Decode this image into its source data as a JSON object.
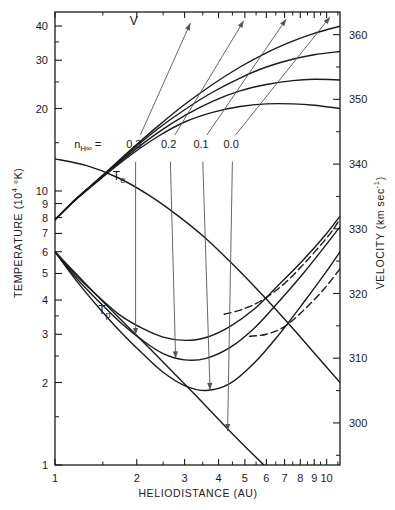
{
  "chart_data": {
    "type": "line",
    "title": "",
    "xlabel": "HELIODISTANCE  (AU)",
    "ylabel": "TEMPERATURE  (10⁴ °K)",
    "y2label": "VELOCITY  (km sec⁻¹)",
    "xscale": "log",
    "yscale": "log",
    "y2scale": "linear",
    "xlim": [
      1,
      11.2
    ],
    "ylim": [
      1,
      45
    ],
    "y2lim": [
      293.5,
      363.5
    ],
    "grid": false,
    "legend_position": "inline-annotations",
    "xticks": [
      1,
      2,
      3,
      4,
      5,
      6,
      7,
      8,
      9,
      10
    ],
    "xtick_labels": [
      "1",
      "2",
      "3",
      "4",
      "5",
      "6",
      "7",
      "8",
      "9",
      "10"
    ],
    "xminor": [
      1.5,
      2.5,
      3.5,
      4.5,
      5.5,
      6.5,
      7.5,
      8.5,
      9.5,
      11
    ],
    "yticks": [
      1,
      2,
      3,
      4,
      5,
      6,
      7,
      8,
      9,
      10,
      20,
      30,
      40
    ],
    "ytick_labels": [
      "1",
      "2",
      "3",
      "4",
      "5",
      "6",
      "7",
      "8",
      "9",
      "10",
      "20",
      "30",
      "40"
    ],
    "ytick_labeled": [
      true,
      true,
      true,
      true,
      true,
      true,
      true,
      true,
      true,
      true,
      true,
      true,
      true
    ],
    "yminor": [
      1.5,
      2.5,
      3.5,
      15,
      25,
      35
    ],
    "y2ticks": [
      300,
      310,
      320,
      330,
      340,
      350,
      360
    ],
    "y2tick_labels": [
      "300",
      "310",
      "320",
      "330",
      "340",
      "350",
      "360"
    ],
    "y2minor": [
      295,
      305,
      315,
      325,
      335,
      345,
      355
    ],
    "parameter_name": "n_H∞",
    "parameter_values": [
      "0.3",
      "0.2",
      "0.1",
      "0.0"
    ],
    "series": [
      {
        "name": "V",
        "label": "V",
        "axis": "right",
        "style": "solid",
        "param": "0.3",
        "points": [
          [
            1,
            331.4
          ],
          [
            1.2,
            334.6
          ],
          [
            1.5,
            338.0
          ],
          [
            1.9,
            341.4
          ],
          [
            2.4,
            344.3
          ],
          [
            3.0,
            346.5
          ],
          [
            3.8,
            348.0
          ],
          [
            4.8,
            348.9
          ],
          [
            6.0,
            349.3
          ],
          [
            7.5,
            349.3
          ],
          [
            9.0,
            349.1
          ],
          [
            11.2,
            348.6
          ]
        ]
      },
      {
        "name": "V",
        "label": "",
        "axis": "right",
        "style": "solid",
        "param": "0.2",
        "points": [
          [
            1,
            331.4
          ],
          [
            1.2,
            334.6
          ],
          [
            1.5,
            338.1
          ],
          [
            1.9,
            341.7
          ],
          [
            2.4,
            344.9
          ],
          [
            3.0,
            347.5
          ],
          [
            3.8,
            349.7
          ],
          [
            4.8,
            351.3
          ],
          [
            6.0,
            352.3
          ],
          [
            7.5,
            352.9
          ],
          [
            9.0,
            353.1
          ],
          [
            11.2,
            353.0
          ]
        ]
      },
      {
        "name": "V",
        "label": "",
        "axis": "right",
        "style": "solid",
        "param": "0.1",
        "points": [
          [
            1,
            331.4
          ],
          [
            1.2,
            334.7
          ],
          [
            1.5,
            338.2
          ],
          [
            1.9,
            342.0
          ],
          [
            2.4,
            345.5
          ],
          [
            3.0,
            348.4
          ],
          [
            3.8,
            351.1
          ],
          [
            4.8,
            353.3
          ],
          [
            6.0,
            355.0
          ],
          [
            7.5,
            356.2
          ],
          [
            9.0,
            356.9
          ],
          [
            11.2,
            357.4
          ]
        ]
      },
      {
        "name": "V",
        "label": "",
        "axis": "right",
        "style": "solid",
        "param": "0.0",
        "points": [
          [
            1,
            331.4
          ],
          [
            1.2,
            334.7
          ],
          [
            1.5,
            338.3
          ],
          [
            1.9,
            342.2
          ],
          [
            2.4,
            345.9
          ],
          [
            3.0,
            349.2
          ],
          [
            3.8,
            352.3
          ],
          [
            4.8,
            355.0
          ],
          [
            6.0,
            357.2
          ],
          [
            7.5,
            359.0
          ],
          [
            9.0,
            360.2
          ],
          [
            11.2,
            361.3
          ]
        ]
      },
      {
        "name": "Te",
        "label": "Tₑ",
        "axis": "left",
        "style": "solid",
        "param": "",
        "points": [
          [
            1,
            13.1
          ],
          [
            1.3,
            12.4
          ],
          [
            1.7,
            11.2
          ],
          [
            2.2,
            9.7
          ],
          [
            2.8,
            8.2
          ],
          [
            3.6,
            6.7
          ],
          [
            4.6,
            5.3
          ],
          [
            5.9,
            4.1
          ],
          [
            7.4,
            3.2
          ],
          [
            9.2,
            2.5
          ],
          [
            11.2,
            2.0
          ]
        ]
      },
      {
        "name": "Tp",
        "label": "Tₚ",
        "axis": "left",
        "style": "solid",
        "param": "0.3",
        "points": [
          [
            1,
            6.0
          ],
          [
            1.2,
            4.9
          ],
          [
            1.45,
            4.1
          ],
          [
            1.75,
            3.5
          ],
          [
            2.1,
            3.15
          ],
          [
            2.5,
            2.93
          ],
          [
            3.0,
            2.85
          ],
          [
            3.6,
            2.92
          ],
          [
            4.4,
            3.2
          ],
          [
            5.4,
            3.7
          ],
          [
            6.6,
            4.5
          ],
          [
            8.2,
            5.6
          ],
          [
            10.0,
            7.0
          ],
          [
            11.2,
            8.1
          ]
        ]
      },
      {
        "name": "Tp",
        "label": "",
        "axis": "left",
        "style": "solid",
        "param": "0.2",
        "points": [
          [
            1,
            6.0
          ],
          [
            1.2,
            4.8
          ],
          [
            1.45,
            3.95
          ],
          [
            1.75,
            3.3
          ],
          [
            2.1,
            2.85
          ],
          [
            2.5,
            2.55
          ],
          [
            3.0,
            2.42
          ],
          [
            3.6,
            2.45
          ],
          [
            4.4,
            2.68
          ],
          [
            5.4,
            3.15
          ],
          [
            6.6,
            3.9
          ],
          [
            8.2,
            5.0
          ],
          [
            10.0,
            6.4
          ],
          [
            11.2,
            7.4
          ]
        ]
      },
      {
        "name": "Tp",
        "label": "",
        "axis": "left",
        "style": "solid",
        "param": "0.1",
        "points": [
          [
            1,
            6.0
          ],
          [
            1.2,
            4.7
          ],
          [
            1.45,
            3.75
          ],
          [
            1.75,
            3.05
          ],
          [
            2.1,
            2.55
          ],
          [
            2.5,
            2.18
          ],
          [
            3.0,
            1.95
          ],
          [
            3.6,
            1.87
          ],
          [
            4.4,
            1.98
          ],
          [
            5.4,
            2.35
          ],
          [
            6.6,
            2.95
          ],
          [
            8.2,
            3.9
          ],
          [
            10.0,
            5.1
          ],
          [
            11.2,
            6.0
          ]
        ]
      },
      {
        "name": "Tp",
        "label": "",
        "axis": "left",
        "style": "solid",
        "param": "0.0",
        "points": [
          [
            1,
            6.0
          ],
          [
            1.5,
            3.95
          ],
          [
            2.2,
            2.7
          ],
          [
            3.2,
            1.85
          ],
          [
            4.6,
            1.27
          ],
          [
            6.0,
            0.98
          ],
          [
            7.0,
            0.85
          ]
        ]
      },
      {
        "name": "dashed-upper",
        "label": "",
        "axis": "left",
        "style": "dashed",
        "param": "",
        "points": [
          [
            4.2,
            3.55
          ],
          [
            4.9,
            3.7
          ],
          [
            5.8,
            4.0
          ],
          [
            7.0,
            4.6
          ],
          [
            8.5,
            5.6
          ],
          [
            10.2,
            6.9
          ],
          [
            11.2,
            7.9
          ]
        ]
      },
      {
        "name": "dashed-lower",
        "label": "",
        "axis": "left",
        "style": "dashed",
        "param": "",
        "points": [
          [
            5.2,
            2.95
          ],
          [
            6.0,
            3.0
          ],
          [
            7.0,
            3.2
          ],
          [
            8.3,
            3.7
          ],
          [
            9.8,
            4.4
          ],
          [
            11.2,
            5.2
          ]
        ]
      }
    ],
    "annotations": [
      {
        "text": "V",
        "x": 1.95,
        "y": 40.5,
        "name": "curve-label-v"
      },
      {
        "text": "Tₑ",
        "x": 1.72,
        "y": 11.0,
        "name": "curve-label-te"
      },
      {
        "text": "Tₚ",
        "x": 1.52,
        "y": 3.55,
        "name": "curve-label-tp"
      },
      {
        "text": "n_H∞ =",
        "x": 1.32,
        "y": 14.3,
        "name": "parameter-name-label"
      },
      {
        "text": "0.3",
        "x": 1.95,
        "y": 14.3,
        "name": "parameter-label-03"
      },
      {
        "text": "0.2",
        "x": 2.62,
        "y": 14.3,
        "name": "parameter-label-02"
      },
      {
        "text": "0.1",
        "x": 3.45,
        "y": 14.3,
        "name": "parameter-label-01"
      },
      {
        "text": "0.0",
        "x": 4.45,
        "y": 14.3,
        "name": "parameter-label-00"
      }
    ],
    "leaders_down": [
      {
        "from": [
          1.98,
          12.8
        ],
        "to": [
          1.98,
          2.98
        ],
        "param": "0.3"
      },
      {
        "from": [
          2.66,
          12.8
        ],
        "to": [
          2.78,
          2.45
        ],
        "param": "0.2"
      },
      {
        "from": [
          3.5,
          12.8
        ],
        "to": [
          3.72,
          1.88
        ],
        "param": "0.1"
      },
      {
        "from": [
          4.5,
          12.8
        ],
        "to": [
          4.32,
          1.33
        ],
        "param": "0.0"
      }
    ],
    "leaders_up": [
      {
        "from": [
          2.06,
          16.0
        ],
        "to": [
          3.15,
          41.0
        ],
        "param": "0.3"
      },
      {
        "from": [
          2.76,
          16.0
        ],
        "to": [
          4.95,
          41.8
        ],
        "param": "0.2"
      },
      {
        "from": [
          3.62,
          16.0
        ],
        "to": [
          7.1,
          42.4
        ],
        "param": "0.1"
      },
      {
        "from": [
          4.62,
          16.0
        ],
        "to": [
          10.3,
          43.2
        ],
        "param": "0.0"
      }
    ],
    "colors": {
      "curve": "#1a1a1a",
      "leader": "#555555",
      "axis": "#1a1a1a",
      "background": "#ffffff"
    }
  }
}
